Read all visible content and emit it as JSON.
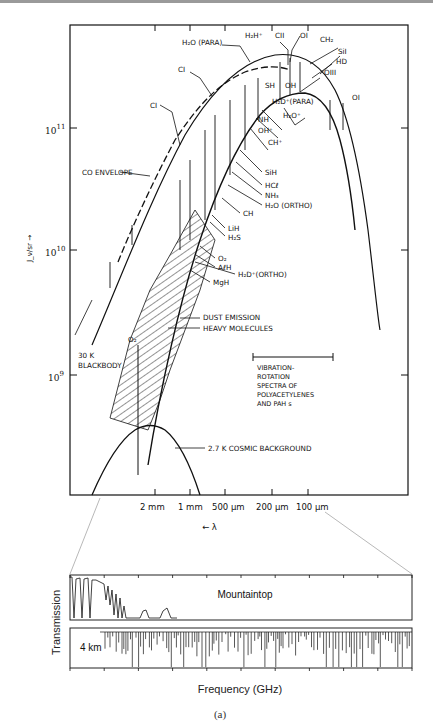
{
  "chart_data": [
    {
      "type": "line",
      "title": "",
      "xlabel": "← λ",
      "ylabel": "J_ν/sr →",
      "x_scale": "log wavelength (decreasing to the right)",
      "y_scale": "log",
      "x_tick_labels": [
        "2 mm",
        "1 mm",
        "500 μm",
        "200 μm",
        "100 μm"
      ],
      "y_tick_labels": [
        {
          "base": "10",
          "exp": "11"
        },
        {
          "base": "10",
          "exp": "10"
        },
        {
          "base": "10",
          "exp": "9"
        }
      ],
      "series": [
        {
          "name": "30 K BLACKBODY",
          "style": "solid"
        },
        {
          "name": "CO ENVELOPE",
          "style": "dashed"
        },
        {
          "name": "DUST EMISSION",
          "style": "solid"
        },
        {
          "name": "HEAVY MOLECULES",
          "style": "hatched band"
        },
        {
          "name": "2.7 K COSMIC BACKGROUND",
          "style": "solid"
        }
      ],
      "line_labels": [
        "H₂O (PARA)",
        "H₂H⁺",
        "CII",
        "OI",
        "CH₂",
        "SiI",
        "HD",
        "OIII",
        "CI",
        "SH",
        "OH",
        "H₂D⁺(PARA)",
        "H₂O⁺",
        "NH",
        "OH⁺",
        "CH⁺",
        "OI",
        "CI",
        "SiH",
        "HCℓ",
        "NH₃",
        "H₂O (ORTHO)",
        "CH",
        "LiH",
        "H₂S",
        "O₂",
        "AℓH",
        "H₂D⁺(ORTHO)",
        "MgH",
        "O₂"
      ],
      "annotations": [
        "CO ENVELOPE",
        "DUST EMISSION",
        "HEAVY MOLECULES",
        "30 K",
        "BLACKBODY",
        "VIBRATION-",
        "ROTATION",
        "SPECTRA OF",
        "POLYACETYLENES",
        "AND PAH s",
        "2.7 K  COSMIC BACKGROUND"
      ]
    },
    {
      "type": "line",
      "title": "",
      "xlabel": "Frequency (GHz)",
      "ylabel": "Transmission",
      "xlim": [
        0,
        3000
      ],
      "panels": [
        {
          "name": "Mountaintop",
          "ylim": [
            0,
            1
          ]
        },
        {
          "name": "4 km",
          "ylim": [
            0,
            1
          ]
        }
      ]
    }
  ],
  "caption": "(a)"
}
